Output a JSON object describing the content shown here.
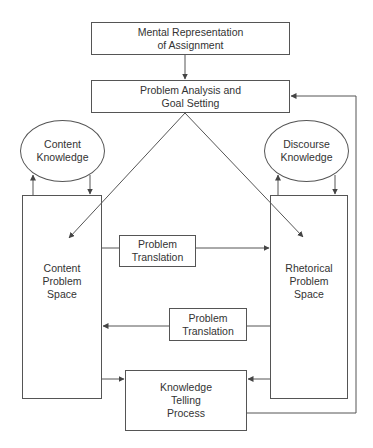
{
  "diagram": {
    "type": "flowchart",
    "colors": {
      "line": "#555555",
      "text": "#333333",
      "background": "#ffffff"
    },
    "nodes": {
      "mental_representation": {
        "label": "Mental Representation\nof Assignment",
        "shape": "rectangle"
      },
      "problem_analysis": {
        "label": "Problem Analysis and\nGoal Setting",
        "shape": "rectangle"
      },
      "content_knowledge": {
        "label": "Content\nKnowledge",
        "shape": "ellipse"
      },
      "discourse_knowledge": {
        "label": "Discourse\nKnowledge",
        "shape": "ellipse"
      },
      "content_problem_space": {
        "label": "Content\nProblem\nSpace",
        "shape": "rectangle"
      },
      "rhetorical_problem_space": {
        "label": "Rhetorical\nProblem\nSpace",
        "shape": "rectangle"
      },
      "problem_translation_upper": {
        "label": "Problem\nTranslation",
        "shape": "rectangle"
      },
      "problem_translation_lower": {
        "label": "Problem\nTranslation",
        "shape": "rectangle"
      },
      "knowledge_telling": {
        "label": "Knowledge\nTelling\nProcess",
        "shape": "rectangle"
      }
    },
    "edges": [
      {
        "from": "mental_representation",
        "to": "problem_analysis"
      },
      {
        "from": "problem_analysis",
        "to": "content_problem_space"
      },
      {
        "from": "problem_analysis",
        "to": "rhetorical_problem_space"
      },
      {
        "from": "content_problem_space",
        "to": "content_knowledge"
      },
      {
        "from": "content_knowledge",
        "to": "content_problem_space"
      },
      {
        "from": "rhetorical_problem_space",
        "to": "discourse_knowledge"
      },
      {
        "from": "discourse_knowledge",
        "to": "rhetorical_problem_space"
      },
      {
        "from": "content_problem_space",
        "to": "rhetorical_problem_space",
        "via": "problem_translation_upper"
      },
      {
        "from": "rhetorical_problem_space",
        "to": "content_problem_space",
        "via": "problem_translation_lower"
      },
      {
        "from": "content_problem_space",
        "to": "knowledge_telling"
      },
      {
        "from": "rhetorical_problem_space",
        "to": "knowledge_telling"
      },
      {
        "from": "knowledge_telling",
        "to": "problem_analysis"
      }
    ]
  }
}
